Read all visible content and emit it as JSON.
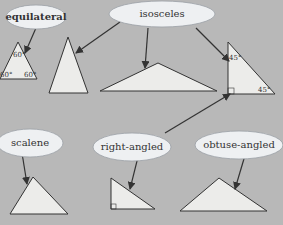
{
  "colors": {
    "background": "#b8b8b8",
    "cloud": "#eef0f2",
    "triangle_fill": "#ececea",
    "stroke": "#333333"
  },
  "labels": {
    "equilateral": "equilateral",
    "isosceles": "isosceles",
    "scalene": "scalene",
    "right_angled": "right-angled",
    "obtuse_angled": "obtuse-angled"
  },
  "angles": {
    "equilateral_top": "60°",
    "equilateral_left": "60°",
    "equilateral_right": "60°",
    "right_iso_top": "45°",
    "right_iso_bottom": "45°"
  }
}
